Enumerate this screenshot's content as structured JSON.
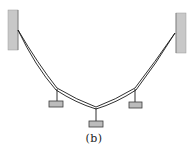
{
  "figure": {
    "caption": "(b)",
    "colors": {
      "background": "#ffffff",
      "wall_fill": "#c8c8c8",
      "wall_edge": "#8a8a8a",
      "cable": "#1a1a1a",
      "block_fill": "#bcbcbc",
      "block_edge": "#3a3a3a"
    },
    "walls": [
      {
        "name": "left-wall",
        "x": 8,
        "y": 10,
        "w": 10,
        "h": 40
      },
      {
        "name": "right-wall",
        "x": 176,
        "y": 13,
        "w": 10,
        "h": 40
      }
    ],
    "joints": [
      {
        "name": "left-anchor",
        "x": 18,
        "y": 30
      },
      {
        "name": "left-hanger",
        "x": 57,
        "y": 89
      },
      {
        "name": "center-hanger",
        "x": 96,
        "y": 108
      },
      {
        "name": "right-hanger",
        "x": 135,
        "y": 89
      },
      {
        "name": "right-anchor",
        "x": 175,
        "y": 33
      }
    ],
    "blocks": [
      {
        "name": "left-block",
        "x": 49,
        "y": 101,
        "w": 14,
        "h": 6
      },
      {
        "name": "center-block",
        "x": 89,
        "y": 121,
        "w": 14,
        "h": 6
      },
      {
        "name": "right-block",
        "x": 129,
        "y": 102,
        "w": 13,
        "h": 6
      }
    ]
  }
}
